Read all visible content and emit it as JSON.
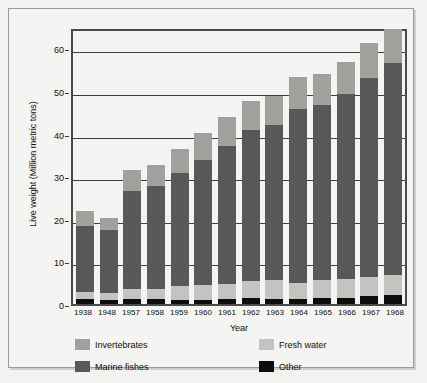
{
  "chart_data": {
    "type": "bar",
    "subtype": "stacked-vertical",
    "title": "",
    "xlabel": "Year",
    "ylabel": "Live weight (Million metric tons)",
    "ylim": [
      0,
      65
    ],
    "yticks": [
      0,
      10,
      20,
      30,
      40,
      50,
      60
    ],
    "grid": true,
    "legend_position": "bottom",
    "categories": [
      "1938",
      "1948",
      "1957",
      "1958",
      "1959",
      "1960",
      "1961",
      "1962",
      "1963",
      "1964",
      "1965",
      "1966",
      "1967",
      "1968"
    ],
    "stack_order_bottom_to_top": [
      "Other",
      "Fresh water",
      "Marine fishes",
      "Invertebrates"
    ],
    "series": [
      {
        "name": "Other",
        "color": "#0d0d0d",
        "values": [
          1.1,
          0.9,
          1.1,
          1.1,
          1.0,
          1.0,
          1.1,
          1.3,
          1.2,
          1.1,
          1.3,
          1.4,
          1.8,
          2.1
        ]
      },
      {
        "name": "Fresh water",
        "color": "#c3c3c0",
        "values": [
          1.7,
          1.7,
          2.4,
          2.4,
          3.2,
          3.4,
          3.6,
          4.1,
          4.4,
          3.8,
          4.3,
          4.4,
          4.6,
          4.8
        ]
      },
      {
        "name": "Marine fishes",
        "color": "#585858",
        "values": [
          15.6,
          14.8,
          23.0,
          24.2,
          26.5,
          29.5,
          32.4,
          35.4,
          36.4,
          40.9,
          41.0,
          43.4,
          46.6,
          49.6
        ]
      },
      {
        "name": "Invertebrates",
        "color": "#a0a09d",
        "values": [
          3.4,
          2.7,
          5.0,
          5.0,
          5.7,
          6.3,
          6.8,
          6.8,
          6.8,
          7.4,
          7.3,
          7.6,
          8.3,
          8.0
        ]
      }
    ],
    "totals": [
      21.8,
      20.1,
      31.5,
      32.7,
      36.4,
      40.2,
      43.9,
      47.6,
      48.8,
      53.2,
      53.9,
      56.8,
      61.3,
      64.5
    ]
  },
  "legend": {
    "items": [
      {
        "label": "Invertebrates",
        "color": "#a0a09d"
      },
      {
        "label": "Fresh water",
        "color": "#c3c3c0"
      },
      {
        "label": "Marine fishes",
        "color": "#585858"
      },
      {
        "label": "Other",
        "color": "#0d0d0d"
      }
    ]
  }
}
